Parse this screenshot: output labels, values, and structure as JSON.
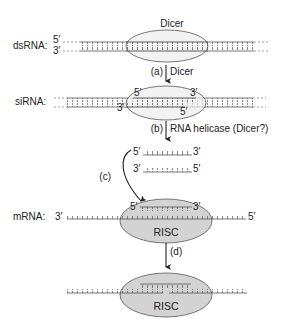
{
  "colors": {
    "dicer_fill": "#ececec",
    "risc_fill": "#d3d3d3",
    "outline": "#555555",
    "strand": "#555555",
    "text": "#222222"
  },
  "stages": {
    "dsrna": {
      "label": "dsRNA:",
      "top_end": "5′",
      "bottom_end": "3′",
      "enzyme": "Dicer"
    },
    "step_a": {
      "letter": "(a)",
      "label": "Dicer"
    },
    "sirna": {
      "label": "siRNA:",
      "top_left": "5′",
      "top_right": "3′",
      "bottom_left": "3′",
      "bottom_right": "5′"
    },
    "step_b": {
      "letter": "(b)",
      "label": "RNA helicase (Dicer?)"
    },
    "separated": {
      "guide_left": "5′",
      "guide_right": "3′",
      "passenger_left": "3′",
      "passenger_right": "5′"
    },
    "step_c": {
      "letter": "(c)"
    },
    "mrna": {
      "label": "mRNA:",
      "left_end": "3′",
      "right_end": "5′",
      "guide_left": "5′",
      "guide_right": "3′",
      "complex": "RISC"
    },
    "step_d": {
      "letter": "(d)"
    },
    "cleaved": {
      "complex": "RISC"
    }
  }
}
